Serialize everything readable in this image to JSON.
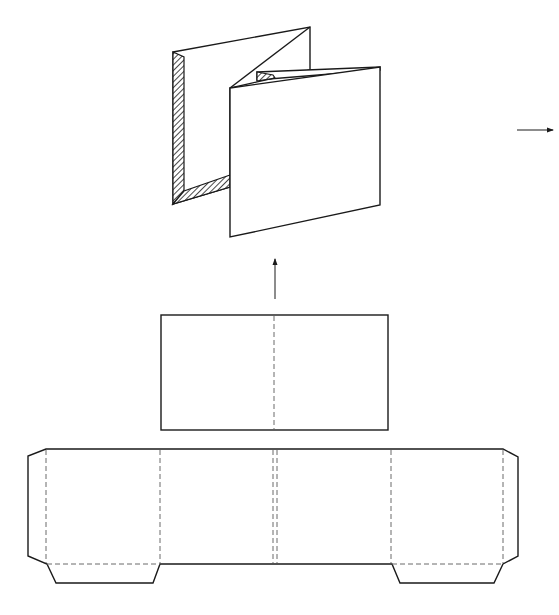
{
  "diagram": {
    "title": "",
    "colors": {
      "stroke": "#1a1a1a",
      "fold_line": "#6a6a6a",
      "background": "#ffffff"
    },
    "parts": [
      {
        "id": "folded-3d-view",
        "label": "",
        "description": "3D view of folded accordion card with hatched glued flaps"
      },
      {
        "id": "arrow-up",
        "label": "",
        "description": "Up arrow from flat card to folded view"
      },
      {
        "id": "arrow-right",
        "label": "",
        "description": "Right arrow at edge"
      },
      {
        "id": "flat-insert-card",
        "label": "",
        "description": "Rectangle with a single dashed center fold line"
      },
      {
        "id": "flat-die-cut",
        "label": "",
        "description": "Four-panel die-cut with side flaps, bottom tabs and double center fold line"
      }
    ]
  }
}
